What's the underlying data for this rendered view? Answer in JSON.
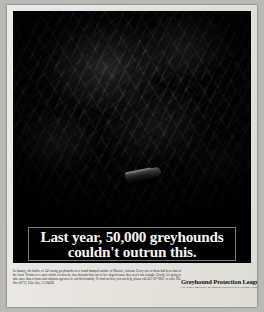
{
  "document": {
    "type": "print-advertisement",
    "medium": "magazine page scan"
  },
  "photo": {
    "alt_description": "dark crumpled plastic sheet with a single rifle cartridge lying on it",
    "subject_icon": "bullet-cartridge-icon",
    "background_color": "#060606"
  },
  "headline": {
    "line1": "Last year, 50,000 greyhounds",
    "line2": "couldn't outrun this.",
    "text_color": "#f4f3ef",
    "background_color": "#000000",
    "border_color": "#7c7c7c"
  },
  "body_copy": {
    "text": "In January, the bodies of 143 racing greyhounds were found dumped outside of Phoenix, Arizona. Every one of them had been shot in the head. Victims of a sport which overbreeds, then discards him out of five dogs because they aren't fast enough. Clearly, it's going to take more than reforms and adoption agencies to end this brutality. To find out how you can help, please call 415-327-0831 or write P.O. Box 60713, Palo Alto, CA 94306."
  },
  "advertiser": {
    "name": "Greyhound Protection League",
    "tagline": "A NATIONAL NETWORK OF PEOPLE WORKING TO SAVE GREYHOUNDS"
  },
  "colors": {
    "page": "#e6e4df",
    "scan_margin": "#b9b9b7",
    "ink": "#2a2926"
  }
}
